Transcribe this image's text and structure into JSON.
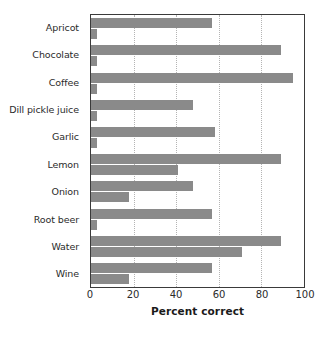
{
  "chart_data": {
    "type": "bar",
    "orientation": "horizontal",
    "title": "",
    "xlabel": "Percent correct",
    "ylabel": "",
    "xlim": [
      0,
      100
    ],
    "xticks": [
      0,
      20,
      40,
      60,
      80,
      100
    ],
    "xtick_labels": [
      "0",
      "20",
      "40",
      "60",
      "80",
      "100"
    ],
    "grid": "vertical-dotted",
    "legend": "none",
    "bar_color": "#8a8a8a",
    "categories": [
      "Apricot",
      "Chocolate",
      "Coffee",
      "Dill pickle juice",
      "Garlic",
      "Lemon",
      "Onion",
      "Root beer",
      "Water",
      "Wine"
    ],
    "series": [
      {
        "name": "upper",
        "values": [
          57,
          89,
          95,
          48,
          58,
          89,
          48,
          57,
          89,
          57
        ]
      },
      {
        "name": "lower",
        "values": [
          3,
          3,
          3,
          3,
          3,
          41,
          18,
          3,
          71,
          18
        ]
      }
    ]
  }
}
